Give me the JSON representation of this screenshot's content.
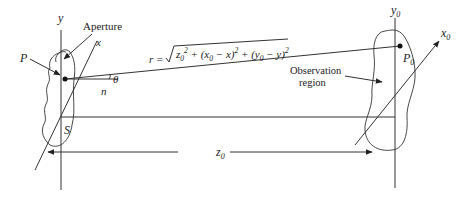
{
  "diagram": {
    "aperture_plane": {
      "y_axis_label": "y",
      "x_axis_label": "x",
      "aperture_label": "Aperture",
      "point_label": "P",
      "area_label": "S",
      "normal_label": "n",
      "angle_label": "θ"
    },
    "observation_plane": {
      "y_axis_label": "y",
      "y_axis_sub": "0",
      "x_axis_label": "x",
      "x_axis_sub": "0",
      "point_label": "P",
      "point_sub": "0",
      "region_label_line1": "Observation",
      "region_label_line2": "region"
    },
    "distance": {
      "label": "z",
      "sub": "0"
    },
    "formula": {
      "lhs": "r =",
      "terms": [
        {
          "base": "z",
          "sub": "0",
          "sup": "2"
        },
        {
          "text": " + (x",
          "sub": "0",
          "rest": " − x)",
          "sup": "2"
        },
        {
          "text": " + (y",
          "sub": "0",
          "rest": " − y)",
          "sup": "2"
        }
      ]
    }
  }
}
